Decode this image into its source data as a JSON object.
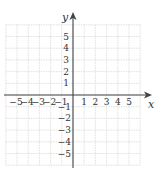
{
  "diagram": {
    "type": "coordinate-plane",
    "x_axis_label": "x",
    "y_axis_label": "y",
    "x_ticks_negative": [
      "-5",
      "-4",
      "-3",
      "-2",
      "-1"
    ],
    "x_ticks_positive": [
      "1",
      "2",
      "3",
      "4",
      "5"
    ],
    "y_ticks_positive": [
      "5",
      "4",
      "3",
      "2",
      "1"
    ],
    "y_ticks_negative": [
      "-1",
      "-2",
      "-3",
      "-4",
      "-5"
    ],
    "x_range": [
      -6,
      6
    ],
    "y_range": [
      -6,
      6
    ],
    "grid": true,
    "colors": {
      "grid": "#d8d8d8",
      "axis": "#444444",
      "label": "#333333"
    }
  }
}
